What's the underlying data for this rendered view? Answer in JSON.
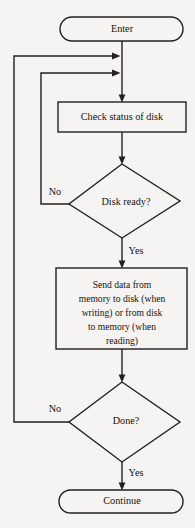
{
  "diagram": {
    "type": "flowchart",
    "colors": {
      "background": "#f5f4f2",
      "stroke": "#23201e",
      "text": "#16130f"
    },
    "nodes": {
      "start": {
        "shape": "terminator",
        "label": "Enter"
      },
      "check_status": {
        "shape": "process",
        "label": "Check status of disk"
      },
      "disk_ready": {
        "shape": "decision",
        "label": "Disk ready?"
      },
      "send_data": {
        "shape": "process",
        "lines": [
          "Send data from",
          "memory to disk (when",
          "writing) or from disk",
          "to memory (when",
          "reading)"
        ]
      },
      "done": {
        "shape": "decision",
        "label": "Done?"
      },
      "end": {
        "shape": "terminator",
        "label": "Continue"
      }
    },
    "branch_labels": {
      "disk_ready_no": "No",
      "disk_ready_yes": "Yes",
      "done_no": "No",
      "done_yes": "Yes"
    }
  }
}
